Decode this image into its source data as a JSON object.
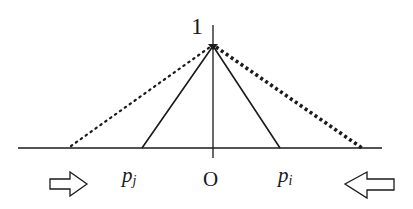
{
  "diagram": {
    "y_axis_label": "1",
    "origin_label": "O",
    "left_point": {
      "base": "p",
      "subscript": "j"
    },
    "right_point": {
      "base": "p",
      "subscript": "i"
    },
    "arrows": [
      {
        "direction": "right",
        "meaning": "inward"
      },
      {
        "direction": "left",
        "meaning": "inward"
      }
    ],
    "curves": [
      {
        "style": "solid",
        "from": "p_j",
        "to": "p_i",
        "peak": 1
      },
      {
        "style": "dotted-light",
        "side": "left"
      },
      {
        "style": "dotted-heavy",
        "side": "right"
      }
    ],
    "line_color": "#1a1a1a"
  }
}
